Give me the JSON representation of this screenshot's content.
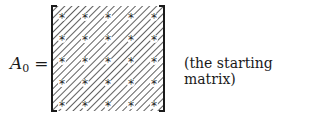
{
  "figure": {
    "label_symbol": "A",
    "label_subscript": "0",
    "equals": "=",
    "caption": "(the starting matrix)",
    "matrix": {
      "rows": 5,
      "cols": 5,
      "entry_symbol": "*",
      "fill": "diagonal-hatch",
      "stroke_color": "#1a1a1a"
    }
  }
}
